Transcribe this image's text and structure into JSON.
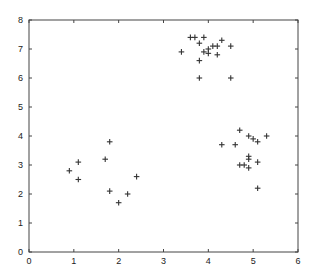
{
  "chart_data": {
    "type": "scatter",
    "title": "",
    "xlabel": "",
    "ylabel": "",
    "xlim": [
      0,
      6
    ],
    "ylim": [
      0,
      8
    ],
    "grid": false,
    "legend": null,
    "marker": "+",
    "marker_color": "#333333",
    "x_ticks": [
      "0",
      "1",
      "2",
      "3",
      "4",
      "5",
      "6"
    ],
    "y_ticks": [
      "0",
      "1",
      "2",
      "3",
      "4",
      "5",
      "6",
      "7",
      "8"
    ],
    "series": [
      {
        "name": "points",
        "points": [
          [
            0.9,
            2.8
          ],
          [
            1.1,
            3.1
          ],
          [
            1.1,
            2.5
          ],
          [
            1.7,
            3.2
          ],
          [
            1.8,
            3.8
          ],
          [
            1.8,
            2.1
          ],
          [
            2.0,
            1.7
          ],
          [
            2.2,
            2.0
          ],
          [
            2.4,
            2.6
          ],
          [
            3.4,
            6.9
          ],
          [
            3.6,
            7.4
          ],
          [
            3.7,
            7.4
          ],
          [
            3.8,
            7.2
          ],
          [
            3.9,
            7.4
          ],
          [
            3.8,
            6.6
          ],
          [
            3.8,
            6.0
          ],
          [
            3.9,
            6.9
          ],
          [
            4.0,
            7.0
          ],
          [
            4.0,
            6.85
          ],
          [
            4.1,
            7.1
          ],
          [
            4.2,
            7.1
          ],
          [
            4.2,
            6.8
          ],
          [
            4.3,
            7.3
          ],
          [
            4.5,
            7.1
          ],
          [
            4.5,
            6.0
          ],
          [
            4.3,
            3.7
          ],
          [
            4.6,
            3.7
          ],
          [
            4.7,
            4.2
          ],
          [
            4.9,
            4.0
          ],
          [
            5.0,
            3.9
          ],
          [
            5.1,
            3.8
          ],
          [
            5.3,
            4.0
          ],
          [
            4.9,
            3.3
          ],
          [
            4.9,
            3.2
          ],
          [
            4.7,
            3.0
          ],
          [
            4.8,
            3.0
          ],
          [
            5.1,
            3.1
          ],
          [
            4.9,
            2.9
          ],
          [
            5.1,
            2.2
          ]
        ]
      }
    ]
  }
}
